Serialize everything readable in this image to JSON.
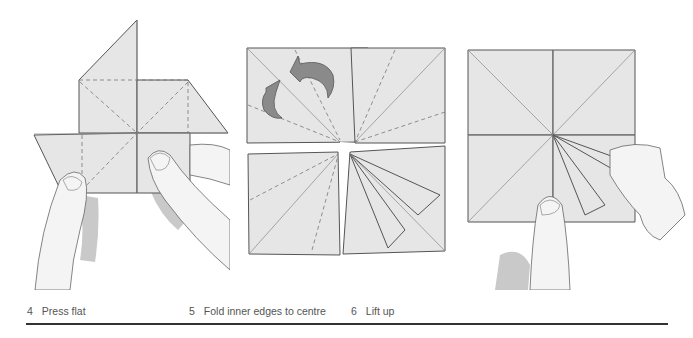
{
  "steps": [
    {
      "number": "4",
      "label": "Press flat"
    },
    {
      "number": "5",
      "label": "Fold inner edges to centre"
    },
    {
      "number": "6",
      "label": "Lift up"
    }
  ],
  "colors": {
    "paper": "#e6e6e6",
    "line": "#555555",
    "arrow": "#8a8a8a",
    "rule": "#333333",
    "caption": "#555555"
  }
}
